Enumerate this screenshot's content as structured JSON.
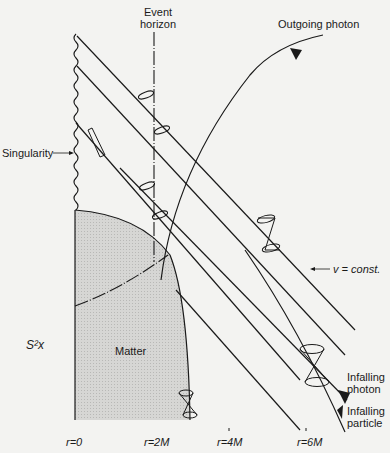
{
  "diagram": {
    "labels": {
      "event_horizon_line1": "Event",
      "event_horizon_line2": "horizon",
      "outgoing_photon": "Outgoing photon",
      "singularity": "Singularity",
      "v_const": "v = const.",
      "s2x": "S²x",
      "matter": "Matter",
      "infalling_photon_line1": "Infalling",
      "infalling_photon_line2": "photon",
      "infalling_particle_line1": "Infalling",
      "infalling_particle_line2": "particle"
    },
    "axis_ticks": [
      "r=0",
      "r=2M",
      "r=4M",
      "r=6M"
    ],
    "colors": {
      "background": "#f3f3f1",
      "ink": "#1a1a1a",
      "matter_fill": "#cfcfcf"
    }
  }
}
